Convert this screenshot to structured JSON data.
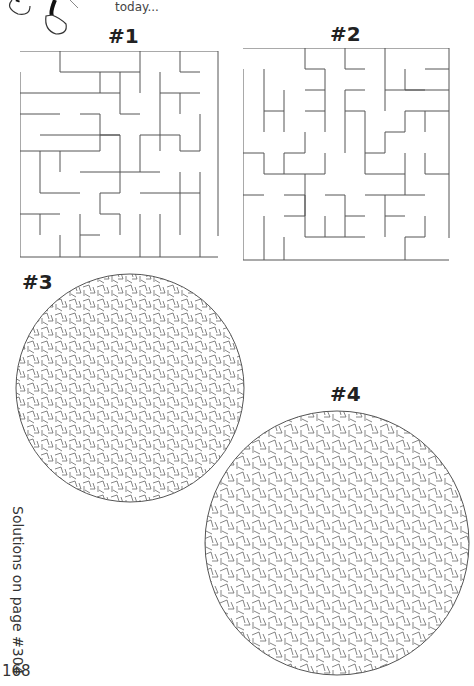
{
  "page": {
    "caption": "today...",
    "page_number": "168",
    "solutions_note": "Solutions on page #304"
  },
  "mazes": [
    {
      "label": "#1",
      "shape": "square"
    },
    {
      "label": "#2",
      "shape": "square"
    },
    {
      "label": "#3",
      "shape": "circle"
    },
    {
      "label": "#4",
      "shape": "circle"
    }
  ],
  "colors": {
    "line": "#555555",
    "text": "#222222",
    "background": "#ffffff"
  }
}
